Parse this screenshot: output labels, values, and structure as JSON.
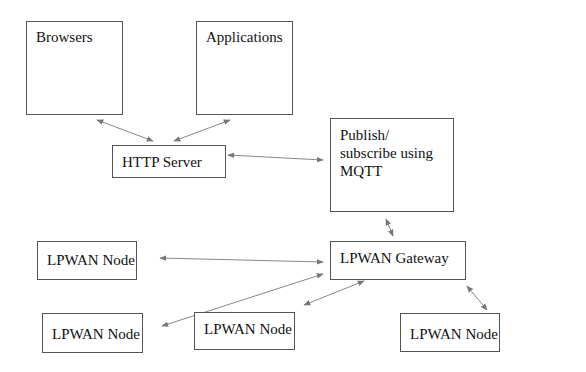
{
  "diagram": {
    "nodes": [
      {
        "id": "browsers",
        "label": "Browsers"
      },
      {
        "id": "applications",
        "label": "Applications"
      },
      {
        "id": "http_server",
        "label": "HTTP Server"
      },
      {
        "id": "mqtt",
        "label": "Publish/\nsubscribe using\nMQTT"
      },
      {
        "id": "gateway",
        "label": "LPWAN Gateway"
      },
      {
        "id": "node1",
        "label": "LPWAN Node"
      },
      {
        "id": "node2",
        "label": "LPWAN Node"
      },
      {
        "id": "node3",
        "label": "LPWAN Node"
      },
      {
        "id": "node4",
        "label": "LPWAN Node"
      }
    ],
    "edges": [
      {
        "from": "browsers",
        "to": "http_server",
        "bidirectional": true
      },
      {
        "from": "applications",
        "to": "http_server",
        "bidirectional": true
      },
      {
        "from": "http_server",
        "to": "mqtt",
        "bidirectional": true
      },
      {
        "from": "mqtt",
        "to": "gateway",
        "bidirectional": true
      },
      {
        "from": "node1",
        "to": "gateway",
        "bidirectional": true
      },
      {
        "from": "node2",
        "to": "gateway",
        "bidirectional": true
      },
      {
        "from": "node3",
        "to": "gateway",
        "bidirectional": true
      },
      {
        "from": "node4",
        "to": "gateway",
        "bidirectional": true
      }
    ],
    "colors": {
      "border": "#555555",
      "arrow": "#777777",
      "text": "#111111",
      "background": "#ffffff"
    }
  }
}
